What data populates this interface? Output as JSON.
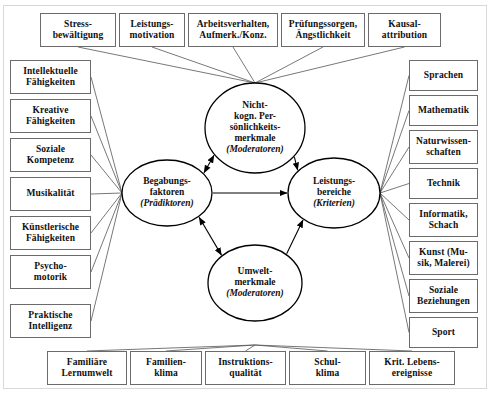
{
  "diagram": {
    "frame_color": "#d8d8d8",
    "box_border_color": "#6b6b6b",
    "line_color": "#555555",
    "ellipse_border_color": "#000000",
    "ellipses": [
      {
        "id": "begabungsfaktoren",
        "label": "Begabungs-\nfaktoren",
        "sublabel": "(Prädiktoren)",
        "cx": 167,
        "cy": 193,
        "rx": 45,
        "ry": 33
      },
      {
        "id": "nichtkognitiv",
        "label": "Nicht-\nkogn. Per-\nsönlichkeits-\nmerkmale",
        "sublabel": "(Moderatoren)",
        "cx": 255,
        "cy": 128,
        "rx": 50,
        "ry": 45
      },
      {
        "id": "leistungsbereiche",
        "label": "Leistungs-\nbereiche",
        "sublabel": "(Kriterien)",
        "cx": 334,
        "cy": 193,
        "rx": 46,
        "ry": 35
      },
      {
        "id": "umweltmerkmale",
        "label": "Umwelt-\nmerkmale",
        "sublabel": "(Moderatoren)",
        "cx": 255,
        "cy": 283,
        "rx": 47,
        "ry": 38
      }
    ],
    "top_boxes": {
      "group": "Nicht-kognitive Persönlichkeitsmerkmale",
      "items": [
        {
          "label": "Stress-\nbewältigung",
          "x": 40,
          "y": 13,
          "w": 76,
          "h": 34
        },
        {
          "label": "Leistungs-\nmotivation",
          "x": 119,
          "y": 13,
          "w": 66,
          "h": 34
        },
        {
          "label": "Arbeitsverhalten,\nAufmerk./Konz.",
          "x": 188,
          "y": 13,
          "w": 90,
          "h": 34
        },
        {
          "label": "Prüfungssorgen,\nÄngstlichkeit",
          "x": 281,
          "y": 13,
          "w": 84,
          "h": 34
        },
        {
          "label": "Kausal-\nattribution",
          "x": 368,
          "y": 13,
          "w": 73,
          "h": 34
        }
      ]
    },
    "left_boxes": {
      "group": "Begabungsfaktoren",
      "items": [
        {
          "label": "Intellektuelle\nFähigkeiten",
          "x": 10,
          "y": 60,
          "w": 81,
          "h": 34
        },
        {
          "label": "Kreative\nFähigkeiten",
          "x": 10,
          "y": 99,
          "w": 81,
          "h": 34
        },
        {
          "label": "Soziale\nKompetenz",
          "x": 10,
          "y": 138,
          "w": 81,
          "h": 34
        },
        {
          "label": "Musikalität",
          "x": 10,
          "y": 177,
          "w": 81,
          "h": 34
        },
        {
          "label": "Künstlerische\nFähigkeiten",
          "x": 10,
          "y": 216,
          "w": 81,
          "h": 34
        },
        {
          "label": "Psycho-\nmotorik",
          "x": 10,
          "y": 255,
          "w": 81,
          "h": 34
        },
        {
          "label": "Praktische\nIntelligenz",
          "x": 10,
          "y": 304,
          "w": 81,
          "h": 34
        }
      ]
    },
    "right_boxes": {
      "group": "Leistungsbereiche",
      "items": [
        {
          "label": "Sprachen",
          "x": 409,
          "y": 60,
          "w": 69,
          "h": 31
        },
        {
          "label": "Mathematik",
          "x": 409,
          "y": 95,
          "w": 69,
          "h": 31
        },
        {
          "label": "Naturwissen-\nschaften",
          "x": 409,
          "y": 130,
          "w": 69,
          "h": 34
        },
        {
          "label": "Technik",
          "x": 409,
          "y": 168,
          "w": 69,
          "h": 31
        },
        {
          "label": "Informatik,\nSchach",
          "x": 409,
          "y": 203,
          "w": 69,
          "h": 34
        },
        {
          "label": "Kunst (Mu-\nsik, Malerei)",
          "x": 409,
          "y": 241,
          "w": 69,
          "h": 34
        },
        {
          "label": "Soziale\nBeziehungen",
          "x": 409,
          "y": 279,
          "w": 69,
          "h": 34
        },
        {
          "label": "Sport",
          "x": 409,
          "y": 317,
          "w": 69,
          "h": 31
        }
      ]
    },
    "bottom_boxes": {
      "group": "Umweltmerkmale",
      "items": [
        {
          "label": "Familiäre\nLernumwelt",
          "x": 47,
          "y": 351,
          "w": 80,
          "h": 34
        },
        {
          "label": "Familien-\nklima",
          "x": 130,
          "y": 351,
          "w": 72,
          "h": 34
        },
        {
          "label": "Instruktions-\nqualität",
          "x": 205,
          "y": 351,
          "w": 81,
          "h": 34
        },
        {
          "label": "Schul-\nklima",
          "x": 289,
          "y": 351,
          "w": 77,
          "h": 34
        },
        {
          "label": "Krit. Lebens-\nereignisse",
          "x": 369,
          "y": 351,
          "w": 86,
          "h": 34
        }
      ]
    },
    "hubs": {
      "top": {
        "x": 255,
        "y": 83
      },
      "left": {
        "x": 122,
        "y": 193
      },
      "right": {
        "x": 380,
        "y": 193
      },
      "bottom": {
        "x": 255,
        "y": 345
      }
    },
    "arrows": [
      {
        "from": "begabungsfaktoren",
        "to": "leistungsbereiche",
        "style": "single"
      },
      {
        "from": "begabungsfaktoren",
        "to": "nichtkognitiv",
        "style": "double"
      },
      {
        "from": "begabungsfaktoren",
        "to": "umweltmerkmale",
        "style": "double"
      },
      {
        "from": "nichtkognitiv",
        "to": "leistungsbereiche",
        "style": "single"
      },
      {
        "from": "umweltmerkmale",
        "to": "leistungsbereiche",
        "style": "single"
      }
    ]
  }
}
